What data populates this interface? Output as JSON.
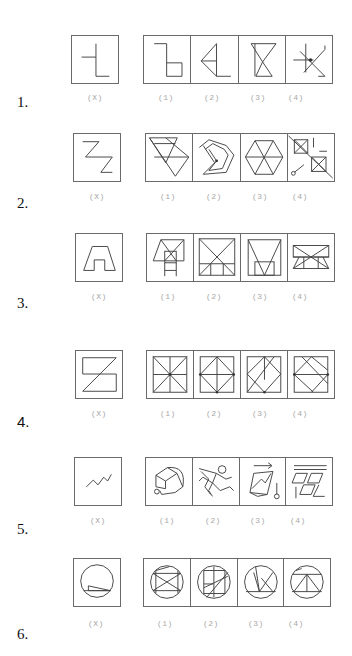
{
  "questions": [
    {
      "number": "1.",
      "x_label": "(X)",
      "option_labels": [
        "(1)",
        "(2)",
        "(3)",
        "(4)"
      ],
      "x_figure": "inverted-t-l-shape",
      "options": [
        "step-shape",
        "triangle-l-shape",
        "hourglass",
        "star-with-arrows"
      ]
    },
    {
      "number": "2.",
      "x_label": "(X)",
      "option_labels": [
        "(1)",
        "(2)",
        "(3)",
        "(4)"
      ],
      "x_figure": "double-z-shape",
      "options": [
        "inverted-triangle-composite",
        "zigzag-polygon",
        "hexagon-with-diagonals",
        "squares-with-arrows"
      ]
    },
    {
      "number": "3.",
      "x_label": "(X)",
      "option_labels": [
        "(1)",
        "(2)",
        "(3)",
        "(4)"
      ],
      "x_figure": "trapezoid-arch",
      "options": [
        "trapezoid-ladder",
        "square-with-x-and-base",
        "trapezoid-v-with-box",
        "rectangle-bowtie"
      ]
    },
    {
      "number": "4.",
      "x_label": "(X)",
      "option_labels": [
        "(1)",
        "(2)",
        "(3)",
        "(4)"
      ],
      "x_figure": "s-shape-with-diagonal",
      "options": [
        "square-eight-spokes",
        "square-inscribed-diamond",
        "square-diagonal-grid",
        "square-crossed-diamond"
      ]
    },
    {
      "number": "5.",
      "x_label": "(X)",
      "option_labels": [
        "(1)",
        "(2)",
        "(3)",
        "(4)"
      ],
      "x_figure": "zigzag-line",
      "options": [
        "polyhedron-with-circle",
        "running-figure",
        "parallelogram-arrow-pendulum",
        "window-grid"
      ]
    },
    {
      "number": "6.",
      "x_label": "(X)",
      "option_labels": [
        "(1)",
        "(2)",
        "(3)",
        "(4)"
      ],
      "x_figure": "circle-with-triangle",
      "options": [
        "circle-crossed-lines",
        "circle-square-grid",
        "circle-triangles",
        "circle-t-triangle"
      ]
    }
  ],
  "colors": {
    "stroke": "#444444",
    "label": "#a8a8a8",
    "border": "#6a6a6a"
  }
}
